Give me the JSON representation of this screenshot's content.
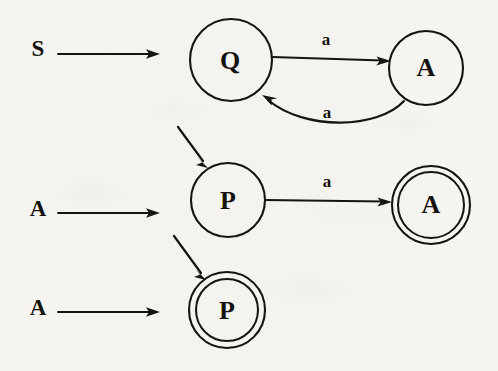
{
  "diagram": {
    "type": "state-transition-diagram",
    "ink_color": "#16140f",
    "background_color": "#f6f5f2",
    "canvas": {
      "width": 498,
      "height": 371
    },
    "start_markers": [
      {
        "id": "start-s",
        "label": "S",
        "label_x": 38,
        "label_y": 51,
        "arrow_x1": 58,
        "arrow_y1": 54,
        "arrow_x2": 158,
        "arrow_y2": 54
      },
      {
        "id": "start-a-middle",
        "label": "A",
        "label_x": 38,
        "label_y": 211,
        "arrow_x1": 58,
        "arrow_y1": 213,
        "arrow_x2": 158,
        "arrow_y2": 213
      },
      {
        "id": "start-a-bottom",
        "label": "A",
        "label_x": 38,
        "label_y": 310,
        "arrow_x1": 58,
        "arrow_y1": 312,
        "arrow_x2": 158,
        "arrow_y2": 312
      }
    ],
    "states": [
      {
        "id": "state-q",
        "label": "Q",
        "cx": 231,
        "cy": 60,
        "r": 41,
        "accepting": false
      },
      {
        "id": "state-a-top",
        "label": "A",
        "cx": 426,
        "cy": 68,
        "r": 37,
        "accepting": false
      },
      {
        "id": "state-p",
        "label": "P",
        "cx": 228,
        "cy": 200,
        "r": 37,
        "accepting": false
      },
      {
        "id": "state-a-accepting",
        "label": "A",
        "cx": 431,
        "cy": 205,
        "r": 39,
        "r_inner": 33,
        "accepting": true
      },
      {
        "id": "state-p-accepting",
        "label": "P",
        "cx": 227,
        "cy": 310,
        "r": 38,
        "r_inner": 31,
        "accepting": true
      }
    ],
    "transitions": [
      {
        "id": "edge-q-to-a",
        "from": "state-q",
        "to": "state-a-top",
        "symbol": "a",
        "label_x": 326,
        "label_y": 41,
        "shape": "straight",
        "x1": 272,
        "y1": 57,
        "x2": 389,
        "y2": 61
      },
      {
        "id": "edge-a-to-q",
        "from": "state-a-top",
        "to": "state-q",
        "symbol": "a",
        "label_x": 327,
        "label_y": 114,
        "shape": "curved",
        "path": "M 403 100 C 375 130, 300 130, 264 96"
      },
      {
        "id": "edge-p-to-a",
        "from": "state-p",
        "to": "state-a-accepting",
        "symbol": "a",
        "label_x": 327,
        "label_y": 183,
        "shape": "straight",
        "x1": 265,
        "y1": 200,
        "x2": 390,
        "y2": 202
      }
    ],
    "start_edges": [
      {
        "id": "edge-start-to-p",
        "to": "state-p",
        "x1": 178,
        "y1": 127,
        "x2": 208,
        "y2": 167
      },
      {
        "id": "edge-start-to-p-accepting",
        "to": "state-p-accepting",
        "x1": 174,
        "y1": 236,
        "x2": 206,
        "y2": 279
      }
    ]
  }
}
